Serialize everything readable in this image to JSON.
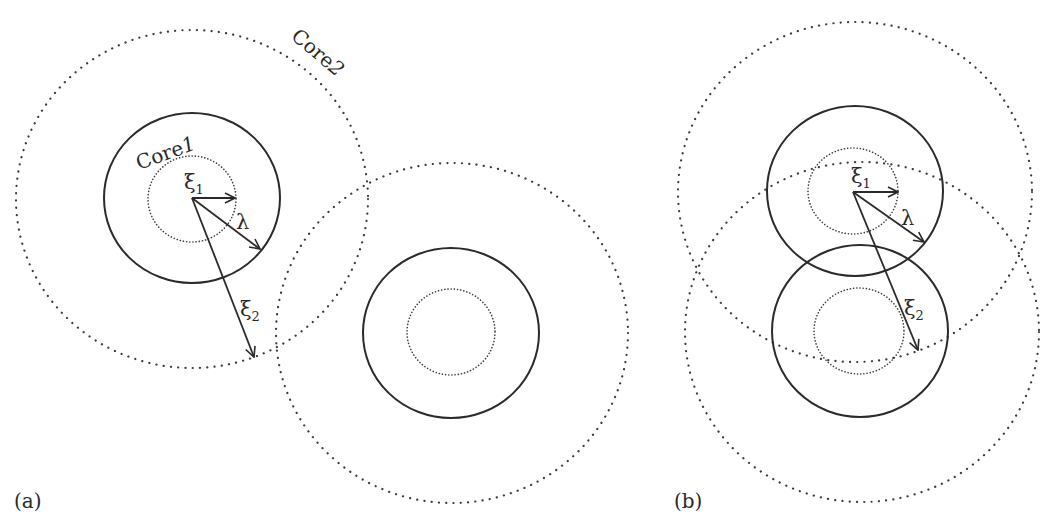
{
  "figure": {
    "panels": [
      {
        "id": "a",
        "label": "(a)",
        "description": "Two separated vortices; each has inner core (xi1), solid circle (lambda), and outer core (xi2)",
        "core1_label": "Core1",
        "core1_label_main": "Core",
        "core1_label_digit": "1",
        "core2_label": "Core2",
        "core2_label_main": "Core",
        "core2_label_digit": "2",
        "xi1_symbol": "ξ",
        "xi1_sub": "1",
        "lambda_symbol": "λ",
        "xi2_symbol": "ξ",
        "xi2_sub": "2",
        "vortices": [
          {
            "cx": 192,
            "cy": 198,
            "inner_r": 44,
            "lambda_r": 88,
            "outer_r": 175
          },
          {
            "cx": 451,
            "cy": 333,
            "inner_r": 44,
            "lambda_r": 87,
            "outer_r": 175
          }
        ]
      },
      {
        "id": "b",
        "label": "(b)",
        "description": "Two overlapping vortices; solid lambda circles nearly touching, outer cores strongly overlapping",
        "xi1_symbol": "ξ",
        "xi1_sub": "1",
        "lambda_symbol": "λ",
        "xi2_symbol": "ξ",
        "xi2_sub": "2",
        "vortices": [
          {
            "cx": 853,
            "cy": 192,
            "inner_r": 44,
            "lambda_r": 88,
            "outer_r": 176
          },
          {
            "cx": 860,
            "cy": 331,
            "inner_r": 44,
            "lambda_r": 87,
            "outer_r": 177
          }
        ]
      }
    ],
    "legend": {
      "inner_dotted": "ξ1 coherence length core",
      "solid": "λ penetration depth",
      "outer_dotted": "ξ2 coherence length core"
    }
  }
}
